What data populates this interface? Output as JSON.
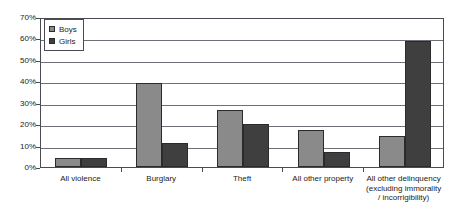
{
  "chart_data": {
    "type": "bar",
    "title": "",
    "subtitle": "",
    "xlabel": "",
    "ylabel": "",
    "ylim": [
      0,
      70
    ],
    "y_tick_labels": [
      "0%",
      "10%",
      "20%",
      "30%",
      "40%",
      "50%",
      "60%",
      "70%"
    ],
    "y_tick_values": [
      0,
      10,
      20,
      30,
      40,
      50,
      60,
      70
    ],
    "grid": true,
    "legend_position": "top-left",
    "categories": [
      "All violence",
      "Burglary",
      "Theft",
      "All other property",
      "All other delinquency (excluding immorality / incorrigibility)"
    ],
    "category_lines": [
      [
        "All violence"
      ],
      [
        "Burglary"
      ],
      [
        "Theft"
      ],
      [
        "All other property"
      ],
      [
        "All other delinquency",
        "(excluding immorality",
        "/ incorrigibility)"
      ]
    ],
    "series": [
      {
        "name": "Boys",
        "color": "#8a8a8a",
        "values": [
          4,
          39,
          26.5,
          17.5,
          14.5
        ]
      },
      {
        "name": "Girls",
        "color": "#3f3f3f",
        "values": [
          4,
          11,
          20,
          7,
          59
        ]
      }
    ]
  },
  "legend": {
    "items": [
      {
        "label": "Boys"
      },
      {
        "label": "Girls"
      }
    ]
  },
  "colors": {
    "boys": "#8a8a8a",
    "girls": "#3f3f3f",
    "axis": "#4a4a52",
    "gridline": "#6f6f78",
    "text": "#1b1b1b",
    "background": "#ffffff"
  }
}
